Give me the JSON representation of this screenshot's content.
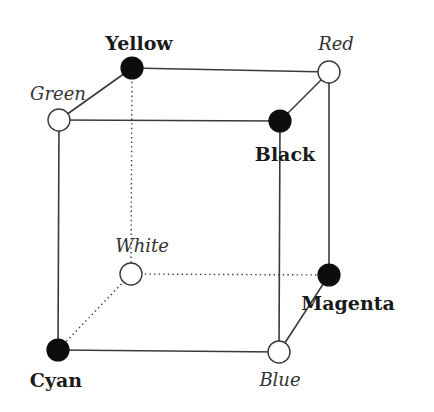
{
  "diagram": {
    "nodes": [
      {
        "id": "yellow",
        "label": "Yellow",
        "style": "bold",
        "filled": true,
        "x": 132,
        "y": 68,
        "lx": 139,
        "ly": 50,
        "anchor": "middle"
      },
      {
        "id": "red",
        "label": "Red",
        "style": "italic",
        "filled": false,
        "x": 329,
        "y": 72,
        "lx": 336,
        "ly": 50,
        "anchor": "middle"
      },
      {
        "id": "green",
        "label": "Green",
        "style": "italic",
        "filled": false,
        "x": 59,
        "y": 120,
        "lx": 58,
        "ly": 100,
        "anchor": "middle"
      },
      {
        "id": "black",
        "label": "Black",
        "style": "bold",
        "filled": true,
        "x": 280,
        "y": 121,
        "lx": 285,
        "ly": 161,
        "anchor": "middle"
      },
      {
        "id": "white",
        "label": "White",
        "style": "italic",
        "filled": false,
        "x": 131,
        "y": 274,
        "lx": 142,
        "ly": 252,
        "anchor": "middle"
      },
      {
        "id": "magenta",
        "label": "Magenta",
        "style": "bold",
        "filled": true,
        "x": 329,
        "y": 275,
        "lx": 348,
        "ly": 310,
        "anchor": "middle"
      },
      {
        "id": "cyan",
        "label": "Cyan",
        "style": "bold",
        "filled": true,
        "x": 58,
        "y": 350,
        "lx": 56,
        "ly": 387,
        "anchor": "middle"
      },
      {
        "id": "blue",
        "label": "Blue",
        "style": "italic",
        "filled": false,
        "x": 279,
        "y": 352,
        "lx": 280,
        "ly": 386,
        "anchor": "middle"
      }
    ],
    "edges": [
      {
        "from": "green",
        "to": "black",
        "dotted": false
      },
      {
        "from": "black",
        "to": "blue",
        "dotted": false
      },
      {
        "from": "blue",
        "to": "cyan",
        "dotted": false
      },
      {
        "from": "cyan",
        "to": "green",
        "dotted": false
      },
      {
        "from": "yellow",
        "to": "red",
        "dotted": false
      },
      {
        "from": "red",
        "to": "magenta",
        "dotted": false
      },
      {
        "from": "green",
        "to": "yellow",
        "dotted": false
      },
      {
        "from": "black",
        "to": "red",
        "dotted": false
      },
      {
        "from": "blue",
        "to": "magenta",
        "dotted": false
      },
      {
        "from": "yellow",
        "to": "white",
        "dotted": true
      },
      {
        "from": "white",
        "to": "magenta",
        "dotted": true
      },
      {
        "from": "white",
        "to": "cyan",
        "dotted": true
      }
    ],
    "node_radius": 11,
    "colors": {
      "line": "#3a3a3a",
      "filled_node": "#0d0d0d",
      "open_node_fill": "#ffffff",
      "background": "#ffffff"
    }
  }
}
